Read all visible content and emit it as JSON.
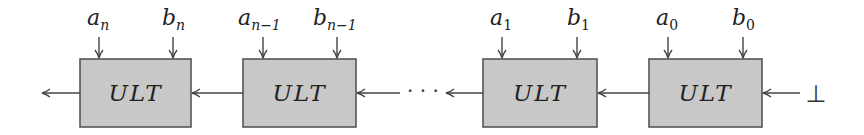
{
  "diagram": {
    "block_label": "ULT",
    "blocks": [
      {
        "id": "block-n",
        "label": "ULT",
        "input_a": {
          "base": "a",
          "sub": "n"
        },
        "input_b": {
          "base": "b",
          "sub": "n"
        }
      },
      {
        "id": "block-n-1",
        "label": "ULT",
        "input_a": {
          "base": "a",
          "sub": "n−1"
        },
        "input_b": {
          "base": "b",
          "sub": "n−1"
        }
      },
      {
        "id": "block-1",
        "label": "ULT",
        "input_a": {
          "base": "a",
          "sub": "1"
        },
        "input_b": {
          "base": "b",
          "sub": "1"
        }
      },
      {
        "id": "block-0",
        "label": "ULT",
        "input_a": {
          "base": "a",
          "sub": "0"
        },
        "input_b": {
          "base": "b",
          "sub": "0"
        }
      }
    ],
    "ellipsis": "· · ·",
    "initial_input": "⊥",
    "colors": {
      "box_fill": "#c8c8c8",
      "box_stroke": "#555555",
      "wire": "#444444"
    }
  }
}
